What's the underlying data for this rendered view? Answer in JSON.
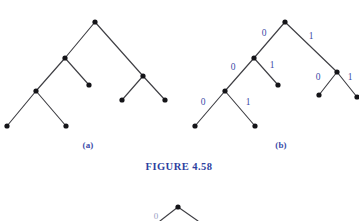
{
  "figure": {
    "caption": "FIGURE 4.58",
    "caption_color": "#2e3fa0",
    "background_color": "#ffffff",
    "node_color": "#141418",
    "edge_color": "#3f3f44",
    "label_color": "#3b4ba8"
  },
  "subfigures": [
    {
      "id": "a",
      "label": "(a)",
      "description": "binary tree without edge labels",
      "nodes": [
        {
          "name": "root",
          "x": 95,
          "y": 22
        },
        {
          "name": "left-child",
          "x": 65,
          "y": 58
        },
        {
          "name": "right-child",
          "x": 143,
          "y": 76
        },
        {
          "name": "left-left-child",
          "x": 36,
          "y": 91
        },
        {
          "name": "left-right-leaf",
          "x": 89,
          "y": 85
        },
        {
          "name": "left-left-leaf-a",
          "x": 7,
          "y": 126
        },
        {
          "name": "left-left-leaf-b",
          "x": 66,
          "y": 126
        },
        {
          "name": "right-left-leaf",
          "x": 122,
          "y": 100
        },
        {
          "name": "right-right-leaf",
          "x": 165,
          "y": 100
        }
      ],
      "edges": [
        {
          "from": "root",
          "to": "left-child",
          "label": ""
        },
        {
          "from": "root",
          "to": "right-child",
          "label": ""
        },
        {
          "from": "left-child",
          "to": "left-left-child",
          "label": ""
        },
        {
          "from": "left-child",
          "to": "left-right-leaf",
          "label": ""
        },
        {
          "from": "left-left-child",
          "to": "left-left-leaf-a",
          "label": ""
        },
        {
          "from": "left-left-child",
          "to": "left-left-leaf-b",
          "label": ""
        },
        {
          "from": "right-child",
          "to": "right-left-leaf",
          "label": ""
        },
        {
          "from": "right-child",
          "to": "right-right-leaf",
          "label": ""
        }
      ],
      "label_position": {
        "x": 88,
        "y": 148
      }
    },
    {
      "id": "b",
      "label": "(b)",
      "description": "same binary tree with edges labeled 0 and 1",
      "nodes": [
        {
          "name": "root",
          "x": 285,
          "y": 22
        },
        {
          "name": "left-child",
          "x": 254,
          "y": 58
        },
        {
          "name": "right-child",
          "x": 337,
          "y": 72
        },
        {
          "name": "left-left-child",
          "x": 225,
          "y": 91
        },
        {
          "name": "left-right-leaf",
          "x": 278,
          "y": 85
        },
        {
          "name": "left-left-leaf-a",
          "x": 195,
          "y": 126
        },
        {
          "name": "left-left-leaf-b",
          "x": 255,
          "y": 126
        },
        {
          "name": "right-left-leaf",
          "x": 319,
          "y": 95
        },
        {
          "name": "right-right-leaf",
          "x": 357,
          "y": 97
        }
      ],
      "edges": [
        {
          "from": "root",
          "to": "left-child",
          "label": "0",
          "lx": 264,
          "ly": 36
        },
        {
          "from": "root",
          "to": "right-child",
          "label": "1",
          "lx": 311,
          "ly": 39
        },
        {
          "from": "left-child",
          "to": "left-left-child",
          "label": "0",
          "lx": 233,
          "ly": 70
        },
        {
          "from": "left-child",
          "to": "left-right-leaf",
          "label": "1",
          "lx": 272,
          "ly": 68
        },
        {
          "from": "left-left-child",
          "to": "left-left-leaf-a",
          "label": "0",
          "lx": 203,
          "ly": 105
        },
        {
          "from": "left-left-child",
          "to": "left-left-leaf-b",
          "label": "1",
          "lx": 248,
          "ly": 105
        },
        {
          "from": "right-child",
          "to": "right-left-leaf",
          "label": "0",
          "lx": 318,
          "ly": 80
        },
        {
          "from": "right-child",
          "to": "right-right-leaf",
          "label": "1",
          "lx": 350,
          "ly": 80
        }
      ],
      "label_position": {
        "x": 281,
        "y": 148
      }
    }
  ],
  "caption_position": {
    "x": 179,
    "y": 170
  },
  "partial_figure": {
    "description": "top of the next figure, cropped at the bottom edge",
    "apex": {
      "x": 178,
      "y": 207
    },
    "edges": [
      {
        "x1": 178,
        "y1": 207,
        "x2": 160,
        "y2": 221
      },
      {
        "x1": 178,
        "y1": 207,
        "x2": 198,
        "y2": 221
      }
    ],
    "label": "0",
    "label_position": {
      "x": 156,
      "y": 219
    }
  }
}
